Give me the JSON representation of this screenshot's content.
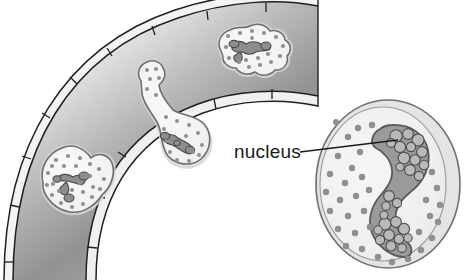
{
  "figure": {
    "title": "",
    "background_color": "#ffffff",
    "width": 466,
    "height": 280
  },
  "labels": [
    {
      "id": "nucleus",
      "text": "nucleus",
      "x": 234,
      "y": 158,
      "leader_line": {
        "x1": 300,
        "y1": 152,
        "x2": 398,
        "y2": 140
      }
    }
  ],
  "colors": {
    "outline": "#2b2b2b",
    "wall_line": "#1f1f1f",
    "wall_band_fill": "#efefef",
    "lumen_light": "#f2f2f2",
    "lumen_dark": "#8a8a8a",
    "cell_body": "#f4f4f4",
    "cell_outline": "#6e6e6e",
    "cell_halo": "#d8d8d8",
    "granule": "#8f8f8f",
    "nucleus_fill": "#9a9a9a",
    "nucleus_outline": "#5a5a5a",
    "chromatin_fill": "#b4b4b4",
    "chromatin_outline": "#4d4d4d",
    "big_cell_fill": "#f1f1f1",
    "big_cell_rim": "#e2e2e2",
    "label_text": "#1a1a1a"
  },
  "vessel": {
    "name": "blood-vessel-wall",
    "description": "curved vessel wall drawn as two concentric arcs with endothelial junction tick marks",
    "outer_band_tick_count": 9,
    "inner_band_tick_count": 6,
    "lumen_shading": "gradient from light at outer edge to dark gray at inner edge"
  },
  "cells": [
    {
      "id": "cell-in-vessel",
      "name": "leukocyte-inside-vessel",
      "position": "top center, within vessel wall",
      "granule_count": 17,
      "nucleus_type": "multilobed"
    },
    {
      "id": "cell-migrating",
      "name": "leukocyte-migrating-diapedesis",
      "position": "middle, squeezing through vessel wall",
      "granule_count": 19,
      "nucleus_type": "multilobed"
    },
    {
      "id": "cell-in-tissue",
      "name": "leukocyte-in-tissue",
      "position": "lower left, outside vessel",
      "granule_count": 24,
      "nucleus_type": "multilobed"
    },
    {
      "id": "cell-enlarged",
      "name": "leukocyte-enlarged-detail",
      "position": "right side, enlarged view",
      "granule_count": 34,
      "nucleus_type": "kidney-shaped with chromatin clumps",
      "chromatin_clump_count": 27
    }
  ]
}
